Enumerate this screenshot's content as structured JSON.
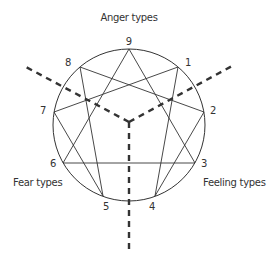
{
  "title": "Anger types",
  "groups": {
    "anger": "Anger types",
    "fear": "Fear types",
    "feeling": "Feeling types"
  },
  "points": [
    {
      "id": "9",
      "label": "9"
    },
    {
      "id": "1",
      "label": "1"
    },
    {
      "id": "2",
      "label": "2"
    },
    {
      "id": "3",
      "label": "3"
    },
    {
      "id": "4",
      "label": "4"
    },
    {
      "id": "5",
      "label": "5"
    },
    {
      "id": "6",
      "label": "6"
    },
    {
      "id": "7",
      "label": "7"
    },
    {
      "id": "8",
      "label": "8"
    }
  ],
  "connections": {
    "triangle": [
      "9",
      "3",
      "6"
    ],
    "hexad": [
      "1",
      "4",
      "2",
      "8",
      "5",
      "7"
    ]
  },
  "colors": {
    "line": "#333333",
    "text": "#333333",
    "background": "#ffffff"
  }
}
